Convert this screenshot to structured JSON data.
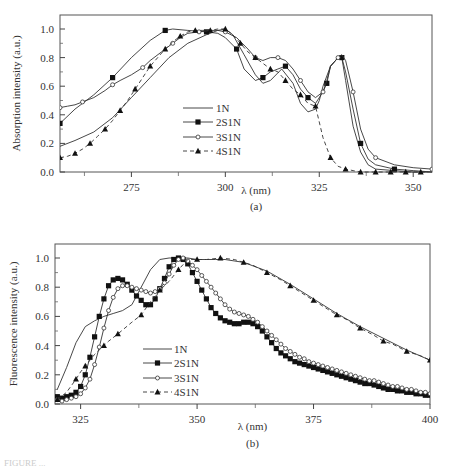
{
  "chart_data": [
    {
      "id": "a",
      "type": "line",
      "panel_label": "(a)",
      "title": "",
      "xlabel": "λ (nm)",
      "ylabel": "Absorption intensity (a.u.)",
      "xlim": [
        256,
        355
      ],
      "ylim": [
        0.0,
        1.1
      ],
      "xticks": [
        275,
        300,
        325,
        350
      ],
      "xminor": [
        262.5,
        287.5,
        312.5,
        337.5
      ],
      "yticks": [
        0.0,
        0.2,
        0.4,
        0.6,
        0.8,
        1.0
      ],
      "yticklabels": [
        "0.0",
        "0.2",
        "0.4",
        "0.6",
        "0.8",
        "1.0"
      ],
      "grid": false,
      "legend_position": "center",
      "series": [
        {
          "name": "1N",
          "marker": "none",
          "dash": false,
          "x": [
            256,
            260,
            265,
            270,
            275,
            280,
            285,
            290,
            295,
            298,
            300,
            302,
            305,
            308,
            310,
            312,
            315,
            318,
            320,
            322,
            324,
            325,
            326,
            328,
            330,
            331,
            332,
            334,
            336,
            338,
            340,
            345,
            350,
            355
          ],
          "y": [
            0.18,
            0.22,
            0.28,
            0.38,
            0.52,
            0.66,
            0.8,
            0.9,
            0.96,
            0.99,
            1.0,
            0.96,
            0.82,
            0.68,
            0.62,
            0.64,
            0.72,
            0.62,
            0.48,
            0.42,
            0.44,
            0.5,
            0.6,
            0.74,
            0.8,
            0.8,
            0.64,
            0.32,
            0.14,
            0.05,
            0.02,
            0.01,
            0.0,
            0.0
          ]
        },
        {
          "name": "2S1N",
          "marker": "square",
          "dash": false,
          "x": [
            256,
            260,
            265,
            270,
            275,
            280,
            284,
            286,
            290,
            295,
            298,
            300,
            303,
            305,
            308,
            310,
            312,
            314,
            316,
            318,
            320,
            322,
            324,
            326,
            327,
            328,
            330,
            331,
            332,
            334,
            336,
            338,
            340,
            345,
            350,
            355
          ],
          "y": [
            0.34,
            0.44,
            0.54,
            0.66,
            0.8,
            0.92,
            0.99,
            1.0,
            0.99,
            0.98,
            0.97,
            0.94,
            0.86,
            0.72,
            0.64,
            0.66,
            0.7,
            0.72,
            0.74,
            0.68,
            0.58,
            0.52,
            0.48,
            0.56,
            0.62,
            0.74,
            0.8,
            0.8,
            0.7,
            0.44,
            0.2,
            0.09,
            0.05,
            0.02,
            0.01,
            0.0
          ]
        },
        {
          "name": "3S1N",
          "marker": "circle",
          "dash": false,
          "x": [
            256,
            258,
            260,
            262,
            265,
            268,
            270,
            272,
            275,
            278,
            280,
            283,
            286,
            288,
            290,
            293,
            296,
            298,
            300,
            303,
            306,
            308,
            310,
            312,
            314,
            316,
            318,
            320,
            322,
            324,
            326,
            327,
            328,
            330,
            331,
            332,
            334,
            336,
            338,
            340,
            345,
            350,
            355
          ],
          "y": [
            0.45,
            0.46,
            0.47,
            0.49,
            0.52,
            0.57,
            0.61,
            0.64,
            0.68,
            0.73,
            0.78,
            0.84,
            0.9,
            0.94,
            0.97,
            0.98,
            0.99,
            0.99,
            0.98,
            0.94,
            0.86,
            0.8,
            0.78,
            0.8,
            0.8,
            0.78,
            0.72,
            0.64,
            0.56,
            0.52,
            0.56,
            0.64,
            0.74,
            0.8,
            0.82,
            0.78,
            0.56,
            0.3,
            0.16,
            0.1,
            0.05,
            0.03,
            0.02
          ]
        },
        {
          "name": "4S1N",
          "marker": "triangle",
          "dash": true,
          "x": [
            256,
            258,
            260,
            262,
            264,
            266,
            268,
            270,
            272,
            274,
            276,
            278,
            280,
            282,
            284,
            286,
            288,
            290,
            292,
            294,
            296,
            298,
            300,
            302,
            304,
            306,
            308,
            310,
            312,
            314,
            316,
            318,
            320,
            322,
            324,
            326,
            328,
            330,
            332,
            334,
            336,
            338,
            340,
            342,
            344,
            346,
            348,
            350,
            352,
            354
          ],
          "y": [
            0.1,
            0.11,
            0.13,
            0.16,
            0.2,
            0.25,
            0.3,
            0.36,
            0.43,
            0.5,
            0.58,
            0.66,
            0.74,
            0.8,
            0.86,
            0.91,
            0.95,
            0.98,
            0.99,
            0.99,
            0.99,
            1.0,
            1.0,
            0.96,
            0.9,
            0.84,
            0.8,
            0.76,
            0.72,
            0.7,
            0.64,
            0.58,
            0.54,
            0.48,
            0.46,
            0.24,
            0.1,
            0.04,
            0.02,
            0.01,
            0.0,
            0.0,
            0.0,
            0.0,
            0.0,
            0.0,
            0.0,
            0.0,
            0.0,
            0.0
          ]
        }
      ]
    },
    {
      "id": "b",
      "type": "line",
      "panel_label": "(b)",
      "title": "",
      "xlabel": "λ (nm)",
      "ylabel": "Fluorescence intensity (a.u.)",
      "xlim": [
        319.5,
        400
      ],
      "ylim": [
        0.0,
        1.1
      ],
      "xticks": [
        325,
        350,
        375,
        400
      ],
      "xminor": [
        337.5,
        362.5,
        387.5
      ],
      "yticks": [
        0.0,
        0.2,
        0.4,
        0.6,
        0.8,
        1.0
      ],
      "yticklabels": [
        "0.0",
        "0.2",
        "0.4",
        "0.6",
        "0.8",
        "1.0"
      ],
      "grid": false,
      "legend_position": "lower center",
      "series": [
        {
          "name": "1N",
          "marker": "none",
          "dash": false,
          "x": [
            320,
            322,
            324,
            326,
            328,
            330,
            332,
            334,
            336,
            338,
            340,
            342,
            344,
            346,
            348,
            350,
            352,
            354,
            356,
            360,
            365,
            370,
            375,
            380,
            385,
            390,
            395,
            400
          ],
          "y": [
            0.1,
            0.25,
            0.42,
            0.53,
            0.57,
            0.6,
            0.62,
            0.64,
            0.68,
            0.8,
            0.92,
            0.99,
            1.0,
            1.0,
            1.0,
            0.99,
            0.99,
            0.99,
            0.99,
            0.97,
            0.91,
            0.82,
            0.72,
            0.62,
            0.53,
            0.45,
            0.37,
            0.3
          ]
        },
        {
          "name": "2S1N",
          "marker": "square",
          "dash": false,
          "x": [
            320,
            321,
            322,
            323,
            324,
            325,
            326,
            327,
            328,
            329,
            330,
            331,
            332,
            333,
            334,
            335,
            336,
            337,
            338,
            339,
            340,
            341,
            342,
            343,
            344,
            345,
            346,
            347,
            348,
            349,
            350,
            351,
            352,
            353,
            354,
            355,
            356,
            357,
            358,
            359,
            360,
            361,
            362,
            363,
            364,
            365,
            366,
            367,
            368,
            369,
            370,
            371,
            372,
            373,
            374,
            375,
            376,
            377,
            378,
            379,
            380,
            381,
            382,
            383,
            384,
            385,
            386,
            387,
            388,
            389,
            390,
            391,
            392,
            393,
            394,
            395,
            396,
            397,
            398,
            399,
            400
          ],
          "y": [
            0.05,
            0.04,
            0.05,
            0.06,
            0.08,
            0.12,
            0.2,
            0.32,
            0.46,
            0.6,
            0.72,
            0.81,
            0.85,
            0.86,
            0.85,
            0.82,
            0.78,
            0.74,
            0.71,
            0.68,
            0.68,
            0.72,
            0.79,
            0.86,
            0.94,
            0.99,
            1.0,
            0.99,
            0.96,
            0.9,
            0.84,
            0.78,
            0.72,
            0.66,
            0.62,
            0.59,
            0.57,
            0.56,
            0.55,
            0.55,
            0.56,
            0.56,
            0.55,
            0.53,
            0.5,
            0.46,
            0.42,
            0.38,
            0.35,
            0.33,
            0.31,
            0.29,
            0.28,
            0.27,
            0.26,
            0.25,
            0.24,
            0.23,
            0.22,
            0.21,
            0.2,
            0.19,
            0.18,
            0.17,
            0.16,
            0.15,
            0.14,
            0.14,
            0.13,
            0.12,
            0.11,
            0.1,
            0.1,
            0.09,
            0.09,
            0.08,
            0.08,
            0.07,
            0.07,
            0.06,
            0.06
          ]
        },
        {
          "name": "3S1N",
          "marker": "circle",
          "dash": false,
          "x": [
            320,
            321,
            322,
            323,
            324,
            325,
            326,
            327,
            328,
            329,
            330,
            331,
            332,
            333,
            334,
            335,
            336,
            337,
            338,
            339,
            340,
            341,
            342,
            343,
            344,
            345,
            346,
            347,
            348,
            349,
            350,
            351,
            352,
            353,
            354,
            355,
            356,
            357,
            358,
            359,
            360,
            361,
            362,
            363,
            364,
            365,
            366,
            367,
            368,
            369,
            370,
            371,
            372,
            373,
            374,
            375,
            376,
            377,
            378,
            379,
            380,
            381,
            382,
            383,
            384,
            385,
            386,
            387,
            388,
            389,
            390,
            391,
            392,
            393,
            394,
            395,
            396,
            397,
            398,
            399,
            400
          ],
          "y": [
            0.03,
            0.02,
            0.03,
            0.04,
            0.05,
            0.07,
            0.11,
            0.17,
            0.27,
            0.39,
            0.52,
            0.64,
            0.73,
            0.79,
            0.81,
            0.81,
            0.8,
            0.79,
            0.78,
            0.77,
            0.76,
            0.77,
            0.79,
            0.83,
            0.89,
            0.95,
            0.99,
            1.0,
            0.98,
            0.95,
            0.92,
            0.88,
            0.84,
            0.8,
            0.76,
            0.72,
            0.68,
            0.65,
            0.63,
            0.62,
            0.61,
            0.6,
            0.58,
            0.56,
            0.53,
            0.5,
            0.47,
            0.44,
            0.41,
            0.38,
            0.36,
            0.34,
            0.32,
            0.31,
            0.29,
            0.28,
            0.27,
            0.26,
            0.25,
            0.24,
            0.23,
            0.22,
            0.21,
            0.2,
            0.19,
            0.18,
            0.17,
            0.16,
            0.16,
            0.15,
            0.14,
            0.13,
            0.12,
            0.12,
            0.11,
            0.1,
            0.1,
            0.09,
            0.08,
            0.08,
            0.07
          ]
        },
        {
          "name": "4S1N",
          "marker": "triangle",
          "dash": true,
          "x": [
            320,
            322,
            324,
            325,
            326,
            328,
            330,
            331,
            333,
            336,
            338,
            340,
            342,
            344,
            346,
            348,
            350,
            352,
            355,
            358,
            360,
            362,
            365,
            368,
            370,
            372,
            375,
            378,
            380,
            382,
            385,
            388,
            390,
            392,
            395,
            398,
            400
          ],
          "y": [
            0.03,
            0.08,
            0.17,
            0.22,
            0.26,
            0.34,
            0.4,
            0.43,
            0.48,
            0.56,
            0.61,
            0.7,
            0.78,
            0.84,
            0.92,
            0.99,
            0.99,
            0.99,
            1.0,
            0.99,
            0.97,
            0.95,
            0.9,
            0.85,
            0.81,
            0.77,
            0.71,
            0.65,
            0.61,
            0.58,
            0.52,
            0.47,
            0.43,
            0.41,
            0.36,
            0.33,
            0.3
          ]
        }
      ]
    }
  ],
  "figure": {
    "panel_a_label": "(a)",
    "panel_b_label": "(b)",
    "caption": "FIGURE ..."
  }
}
